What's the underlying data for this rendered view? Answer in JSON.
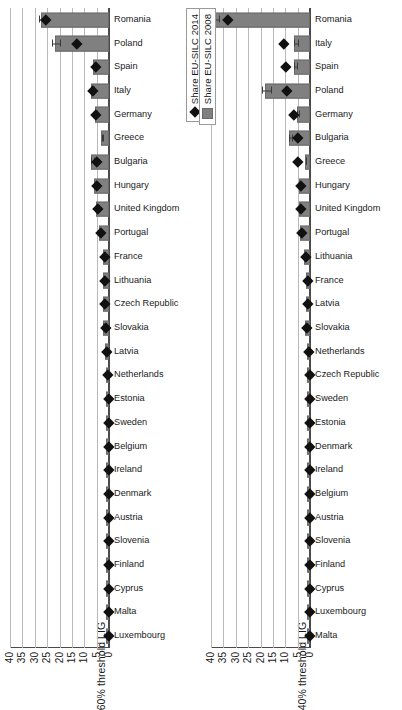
{
  "figure": {
    "orientation": "rotated-90",
    "colors": {
      "bar": "#808080",
      "marker": "#111111",
      "grid": "#b9b9b9",
      "axis": "#4a4a4a"
    }
  },
  "legend": {
    "series_2014_label": "Share EU-SILC 2014",
    "series_2008_label": "Share EU-SILC 2008",
    "marker_2014": "diamond-marker",
    "marker_2008": "square-swatch"
  },
  "chart_data": [
    {
      "type": "bar",
      "panel": "top",
      "title": "",
      "ylabel": "60% threshold LIG",
      "xlabel": "",
      "ylim": [
        0,
        40
      ],
      "yticks": [
        0,
        5,
        10,
        15,
        20,
        25,
        30,
        35,
        40
      ],
      "grid": true,
      "legend_position": "bottom-right",
      "categories": [
        "Luxembourg",
        "Malta",
        "Cyprus",
        "Finland",
        "Slovenia",
        "Austria",
        "Denmark",
        "Ireland",
        "Belgium",
        "Sweden",
        "Estonia",
        "Netherlands",
        "Latvia",
        "Slovakia",
        "Czech Republic",
        "Lithuania",
        "France",
        "Portugal",
        "United Kingdom",
        "Hungary",
        "Bulgaria",
        "Greece",
        "Germany",
        "Italy",
        "Spain",
        "Poland",
        "Romania"
      ],
      "series": [
        {
          "name": "Share EU-SILC 2008",
          "render": "bar",
          "values": [
            0.1,
            0.1,
            0.1,
            0.1,
            0.1,
            0.1,
            0.1,
            0.1,
            0.2,
            0.2,
            0.3,
            0.5,
            0.9,
            1.6,
            1.5,
            1.5,
            1.7,
            3.3,
            4.3,
            5.2,
            6.6,
            2.3,
            5.0,
            6.4,
            5.6,
            21.2,
            26.6
          ],
          "errors": [
            0,
            0,
            0,
            0,
            0,
            0,
            0,
            0,
            0,
            0,
            0,
            0.2,
            0.3,
            0.9,
            0.4,
            0.3,
            0.4,
            0.5,
            0.5,
            0.6,
            0.8,
            0.4,
            0.5,
            0.7,
            0.6,
            1.9,
            1.5
          ]
        },
        {
          "name": "Share EU-SILC 2014",
          "render": "diamond",
          "values": [
            0.1,
            0.1,
            0.1,
            0.1,
            0.1,
            0.1,
            0.1,
            0.1,
            0.2,
            0.2,
            0.3,
            0.6,
            1.1,
            1.6,
            1.8,
            1.7,
            2.0,
            3.6,
            4.7,
            5.0,
            5.0,
            null,
            5.5,
            6.7,
            5.6,
            13.0,
            25.7
          ]
        }
      ]
    },
    {
      "type": "bar",
      "panel": "bottom",
      "title": "",
      "ylabel": "40% threshold LIG",
      "xlabel": "",
      "ylim": [
        0,
        40
      ],
      "yticks": [
        0,
        5,
        10,
        15,
        20,
        25,
        30,
        35,
        40
      ],
      "grid": true,
      "legend_position": "top-right",
      "categories": [
        "Malta",
        "Luxembourg",
        "Cyprus",
        "Finland",
        "Slovenia",
        "Austria",
        "Belgium",
        "Ireland",
        "Denmark",
        "Estonia",
        "Sweden",
        "Czech Republic",
        "Netherlands",
        "Slovakia",
        "Latvia",
        "France",
        "Lithuania",
        "Portugal",
        "United Kingdom",
        "Hungary",
        "Greece",
        "Bulgaria",
        "Germany",
        "Poland",
        "Spain",
        "Italy",
        "Romania"
      ],
      "series": [
        {
          "name": "Share EU-SILC 2008",
          "render": "bar",
          "values": [
            0.1,
            0.1,
            0.1,
            0.1,
            0.1,
            0.1,
            0.1,
            0.1,
            0.1,
            0.2,
            0.3,
            0.4,
            0.5,
            1.4,
            1.0,
            1.0,
            1.6,
            3.2,
            3.6,
            3.6,
            1.4,
            7.7,
            4.6,
            17.5,
            5.5,
            5.5,
            38.0
          ],
          "errors": [
            0,
            0,
            0,
            0,
            0,
            0,
            0,
            0,
            0,
            0,
            0,
            0,
            0.1,
            0.4,
            0.2,
            0.2,
            0.3,
            0.3,
            0.3,
            0.3,
            0.3,
            0.8,
            0.6,
            2.0,
            0.8,
            0.9,
            1.8
          ]
        },
        {
          "name": "Share EU-SILC 2014",
          "render": "diamond",
          "values": [
            0.1,
            0.1,
            0.1,
            0.1,
            0.1,
            0.1,
            0.1,
            0.1,
            0.1,
            0.2,
            0.3,
            0.4,
            0.5,
            1.5,
            1.0,
            1.0,
            1.9,
            3.6,
            3.9,
            3.9,
            5.0,
            5.2,
            6.8,
            9.7,
            10.0,
            10.6,
            33.5
          ]
        }
      ]
    }
  ]
}
